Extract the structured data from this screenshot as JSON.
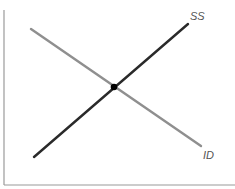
{
  "diagram": {
    "type": "supply-demand-style cross",
    "axes": {
      "x_label": "",
      "y_label": "",
      "color": "#9a9a9a"
    },
    "curves": [
      {
        "id": "ss",
        "label": "SS",
        "color": "#2a2a2a",
        "slope": "upward",
        "start": [
          34,
          157
        ],
        "end": [
          188,
          24
        ]
      },
      {
        "id": "id",
        "label": "ID",
        "color": "#8f8f8f",
        "slope": "downward",
        "start": [
          31,
          29
        ],
        "end": [
          201,
          146
        ]
      }
    ],
    "equilibrium": {
      "label": "",
      "point": [
        114,
        87
      ],
      "color": "#000000"
    }
  }
}
